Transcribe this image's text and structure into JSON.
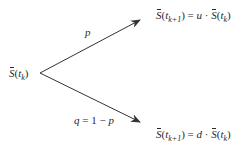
{
  "diagram": {
    "type": "binomial-tree-one-step",
    "root_node": {
      "symbol": "S",
      "arg": "t",
      "arg_sub": "k",
      "label": "S̄(t_k)"
    },
    "up_branch": {
      "probability_label": "p",
      "result": {
        "lhs_symbol": "S",
        "lhs_arg": "t",
        "lhs_sub": "k+1",
        "factor": "u",
        "rhs_symbol": "S",
        "rhs_arg": "t",
        "rhs_sub": "k",
        "label": "S̄(t_{k+1}) = u · S̄(t_k)"
      }
    },
    "down_branch": {
      "probability_label": "q = 1 − p",
      "prob_q": "q",
      "prob_eq": "= 1 −",
      "prob_p": "p",
      "result": {
        "lhs_symbol": "S",
        "lhs_arg": "t",
        "lhs_sub": "k+1",
        "factor": "d",
        "rhs_symbol": "S",
        "rhs_arg": "t",
        "rhs_sub": "k",
        "label": "S̄(t_{k+1}) = d · S̄(t_k)"
      }
    },
    "symbols": {
      "open": "(",
      "close": ")",
      "equals": " = ",
      "dot": " · "
    },
    "colors": {
      "line": "#333333",
      "text": "#2a2a2a",
      "background": "#ffffff"
    }
  }
}
